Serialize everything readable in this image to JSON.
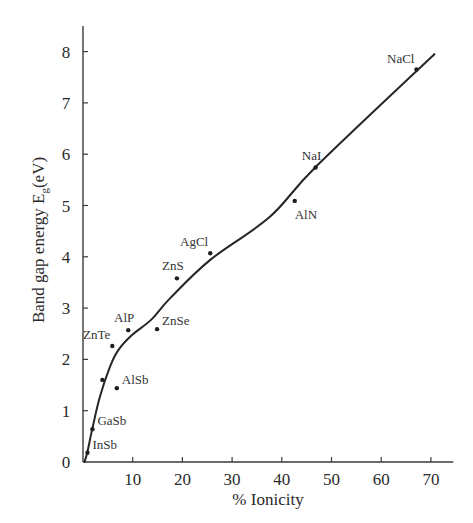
{
  "chart_data": {
    "type": "scatter",
    "title": "",
    "xlabel": "% Ionicity",
    "ylabel_main": "Band gap energy E",
    "ylabel_sub": "g",
    "ylabel_unit": "(eV)",
    "xlim": [
      0,
      74.5
    ],
    "ylim": [
      0,
      8.6
    ],
    "grid": false,
    "legend": "none",
    "x_ticks": [
      10,
      20,
      30,
      40,
      50,
      60,
      70
    ],
    "x_tick_labels": [
      "10",
      "20",
      "30",
      "40",
      "50",
      "60",
      "70"
    ],
    "y_ticks": [
      0,
      1,
      2,
      3,
      4,
      5,
      6,
      7,
      8
    ],
    "y_tick_labels": [
      "0",
      "1",
      "2",
      "3",
      "4",
      "5",
      "6",
      "7",
      "8"
    ],
    "points": [
      {
        "label": "InSb",
        "x": 0.9,
        "y": 0.18,
        "label_pos": "right"
      },
      {
        "label": "GaSb",
        "x": 1.9,
        "y": 0.64,
        "label_pos": "right"
      },
      {
        "label": "",
        "x": 3.9,
        "y": 1.6,
        "label_pos": "none"
      },
      {
        "label": "AlSb",
        "x": 6.8,
        "y": 1.44,
        "label_pos": "right"
      },
      {
        "label": "ZnTe",
        "x": 5.9,
        "y": 2.26,
        "label_pos": "above-left"
      },
      {
        "label": "AlP",
        "x": 9.1,
        "y": 2.57,
        "label_pos": "above"
      },
      {
        "label": "ZnSe",
        "x": 14.9,
        "y": 2.59,
        "label_pos": "right"
      },
      {
        "label": "ZnS",
        "x": 18.9,
        "y": 3.58,
        "label_pos": "above"
      },
      {
        "label": "AgCl",
        "x": 25.6,
        "y": 4.07,
        "label_pos": "above-left"
      },
      {
        "label": "AlN",
        "x": 42.6,
        "y": 5.09,
        "label_pos": "below"
      },
      {
        "label": "NaI",
        "x": 46.8,
        "y": 5.74,
        "label_pos": "above"
      },
      {
        "label": "NaCl",
        "x": 67.1,
        "y": 7.65,
        "label_pos": "above-left"
      }
    ],
    "trend_curve": {
      "x": [
        0.3,
        0.9,
        1.9,
        3.4,
        5.4,
        7.1,
        9.8,
        13.8,
        17.5,
        25.6,
        37.6,
        47.0,
        70.7
      ],
      "y": [
        0.0,
        0.2,
        0.66,
        1.27,
        1.85,
        2.18,
        2.47,
        2.78,
        3.19,
        3.94,
        4.78,
        5.77,
        7.95
      ]
    }
  }
}
